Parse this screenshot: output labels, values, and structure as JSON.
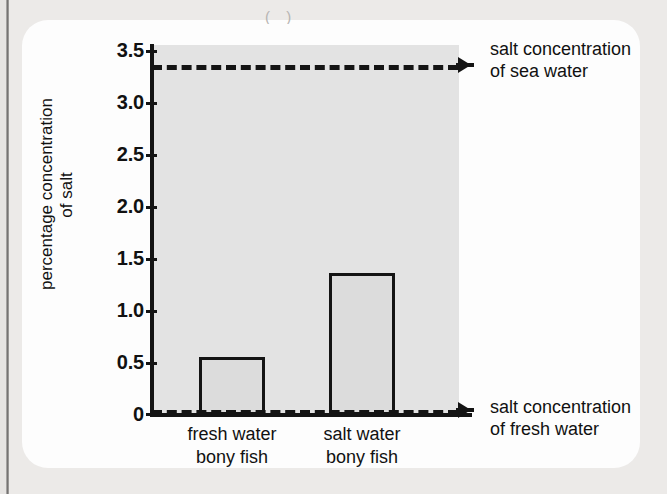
{
  "figure": {
    "crop_glyph": "( )"
  },
  "chart_data": {
    "type": "bar",
    "title": "",
    "xlabel": "",
    "ylabel": "percentage concentration of salt",
    "ylabel_lines": [
      "percentage concentration",
      "of salt"
    ],
    "categories": [
      "fresh water bony fish",
      "salt water bony fish"
    ],
    "category_lines": [
      [
        "fresh water",
        "bony fish"
      ],
      [
        "salt water",
        "bony fish"
      ]
    ],
    "values": [
      0.58,
      1.42
    ],
    "ylim": [
      0,
      3.7
    ],
    "yticks": [
      0,
      0.5,
      1.0,
      1.5,
      2.0,
      2.5,
      3.0,
      3.5
    ],
    "ytick_labels": [
      "0",
      "0.5",
      "1.0",
      "1.5",
      "2.0",
      "2.5",
      "3.0",
      "3.5"
    ],
    "grid": false,
    "legend": "none",
    "bar_fill": "#dcdcdc",
    "bar_stroke": "#141414",
    "plot_background": "#e3e3e3",
    "reference_lines": [
      {
        "name": "sea-water",
        "value": 3.5,
        "style": "dashed",
        "label_lines": [
          "salt concentration",
          "of sea water"
        ]
      },
      {
        "name": "fresh-water",
        "value": 0.05,
        "style": "dashed",
        "label_lines": [
          "salt concentration",
          "of fresh water"
        ]
      }
    ]
  }
}
